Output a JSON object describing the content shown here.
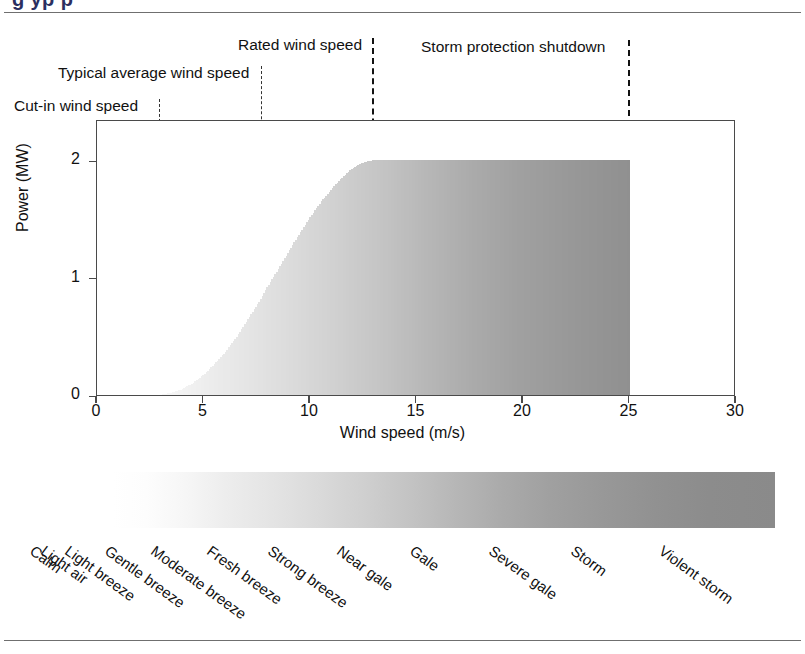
{
  "figure": {
    "title_partial": "g       yp                          p",
    "domain": "chart"
  },
  "annotations": [
    {
      "id": "cut-in",
      "label": "Cut-in wind speed",
      "x_value": 3.0,
      "label_x": 14,
      "label_y": 97
    },
    {
      "id": "typical",
      "label": "Typical average wind speed",
      "x_value": 7.8,
      "label_x": 58,
      "label_y": 64
    },
    {
      "id": "rated",
      "label": "Rated wind speed",
      "x_value": 13.0,
      "label_x": 238,
      "label_y": 36
    },
    {
      "id": "storm",
      "label": "Storm protection shutdown",
      "x_value": 25.0,
      "label_x": 421,
      "label_y": 38
    }
  ],
  "chart_data": {
    "type": "area",
    "xlabel": "Wind speed (m/s)",
    "ylabel": "Power (MW)",
    "xlim": [
      0,
      30
    ],
    "ylim": [
      0,
      2.35
    ],
    "xticks": [
      0,
      5,
      10,
      15,
      20,
      25,
      30
    ],
    "yticks": [
      0,
      1,
      2
    ],
    "grid": false,
    "legend": "none",
    "series": [
      {
        "name": "Power output",
        "x": [
          0,
          1,
          2,
          3,
          3.5,
          4,
          4.5,
          5,
          5.5,
          6,
          6.5,
          7,
          7.5,
          8,
          8.5,
          9,
          9.5,
          10,
          10.5,
          11,
          11.5,
          12,
          12.5,
          13,
          14,
          16,
          18,
          20,
          22,
          24,
          25,
          25.01,
          26,
          28,
          30
        ],
        "y": [
          0,
          0,
          0,
          0,
          0.02,
          0.05,
          0.1,
          0.17,
          0.26,
          0.36,
          0.48,
          0.62,
          0.76,
          0.92,
          1.07,
          1.22,
          1.37,
          1.51,
          1.64,
          1.75,
          1.85,
          1.93,
          1.98,
          2.0,
          2.0,
          2.0,
          2.0,
          2.0,
          2.0,
          2.0,
          2.0,
          0,
          0,
          0,
          0
        ]
      }
    ],
    "markers": {
      "cut_in_wind_speed": 3.0,
      "typical_average_wind_speed": 7.8,
      "rated_wind_speed": 13.0,
      "storm_protection_shutdown": 25.0,
      "rated_power_mw": 2.0
    },
    "beaufort_scale": {
      "bar_range_ms": [
        0,
        30
      ],
      "colormap": "white-to-dark-grey",
      "categories": [
        {
          "name": "Calm",
          "beaufort": 0,
          "x_start": 0
        },
        {
          "name": "Light air",
          "beaufort": 1,
          "x_start": 0.5
        },
        {
          "name": "Light breeze",
          "beaufort": 2,
          "x_start": 1.6
        },
        {
          "name": "Gentle breeze",
          "beaufort": 3,
          "x_start": 3.4
        },
        {
          "name": "Moderate breeze",
          "beaufort": 4,
          "x_start": 5.5
        },
        {
          "name": "Fresh breeze",
          "beaufort": 5,
          "x_start": 8.0
        },
        {
          "name": "Strong breeze",
          "beaufort": 6,
          "x_start": 10.8
        },
        {
          "name": "Near gale",
          "beaufort": 7,
          "x_start": 13.9
        },
        {
          "name": "Gale",
          "beaufort": 8,
          "x_start": 17.2
        },
        {
          "name": "Severe gale",
          "beaufort": 9,
          "x_start": 20.8
        },
        {
          "name": "Storm",
          "beaufort": 10,
          "x_start": 24.5
        },
        {
          "name": "Violent storm",
          "beaufort": 11,
          "x_start": 28.5
        }
      ]
    }
  },
  "colors": {
    "frame": "#4a4a4a",
    "dash": "#111111",
    "text": "#111111",
    "title": "#2b2f60",
    "rule": "#6f6f6f"
  }
}
